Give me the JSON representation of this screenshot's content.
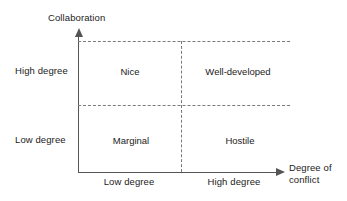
{
  "diagram": {
    "type": "2x2-matrix",
    "y_axis": {
      "title": "Collaboration",
      "levels": [
        "High degree",
        "Low degree"
      ]
    },
    "x_axis": {
      "title_line1": "Degree of",
      "title_line2": "conflict",
      "levels": [
        "Low degree",
        "High degree"
      ]
    },
    "quadrants": [
      {
        "id": "top-left",
        "label": "Nice",
        "collaboration": "High degree",
        "conflict": "Low degree"
      },
      {
        "id": "top-right",
        "label": "Well-developed",
        "collaboration": "High degree",
        "conflict": "High degree"
      },
      {
        "id": "bottom-left",
        "label": "Marginal",
        "collaboration": "Low degree",
        "conflict": "Low degree"
      },
      {
        "id": "bottom-right",
        "label": "Hostile",
        "collaboration": "Low degree",
        "conflict": "High degree"
      }
    ],
    "colors": {
      "background": "#ffffff",
      "axis": "#555555",
      "grid": "#7a7a7a",
      "text": "#222222"
    }
  }
}
